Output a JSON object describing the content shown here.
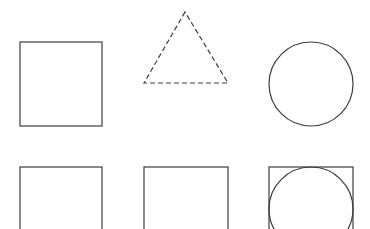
{
  "canvas": {
    "width": 370,
    "height": 229,
    "background": "#ffffff"
  },
  "style": {
    "stroke": "#3c3c3c",
    "stroke_width": 1.2,
    "dash": "5,3"
  },
  "shapes": {
    "top_row": {
      "square": {
        "x": 20,
        "y": 42,
        "w": 82,
        "h": 84,
        "style": "solid"
      },
      "triangle": {
        "points": "185,12 144,83 228,83",
        "style": "dashed"
      },
      "circle": {
        "cx": 311,
        "cy": 84,
        "r": 42,
        "style": "solid"
      }
    },
    "bottom_row": {
      "square_left": {
        "x": 20,
        "y": 167,
        "w": 82,
        "h": 84,
        "style": "solid"
      },
      "square_middle": {
        "x": 144,
        "y": 167,
        "w": 84,
        "h": 84,
        "style": "solid"
      },
      "square_with_circle": {
        "square": {
          "x": 269,
          "y": 167,
          "w": 84,
          "h": 84
        },
        "circle": {
          "cx": 311,
          "cy": 209,
          "r": 42
        }
      }
    }
  }
}
